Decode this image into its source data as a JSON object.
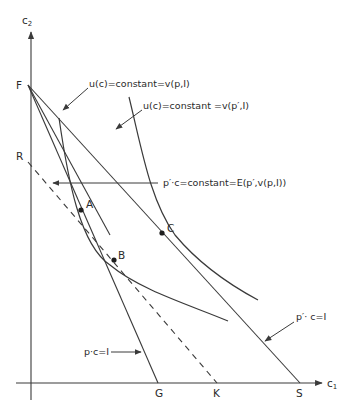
{
  "axes": {
    "y_label": "c",
    "y_sub": "2",
    "x_label": "c",
    "x_sub": "1"
  },
  "points": {
    "F": "F",
    "R": "R",
    "A": "A",
    "B": "B",
    "C": "C",
    "G": "G",
    "K": "K",
    "S": "S"
  },
  "annotations": {
    "indiff_low": "u(c)=constant=v(p,I)",
    "indiff_high": "u(c)=constant =v(p′,I)",
    "expenditure": "p′·c=constant=E(p′,v(p,I))",
    "budget_new": "p′· c=I",
    "budget_old": "p·c=I"
  },
  "colors": {
    "ink": "#3a3a3a",
    "background": "#ffffff"
  }
}
